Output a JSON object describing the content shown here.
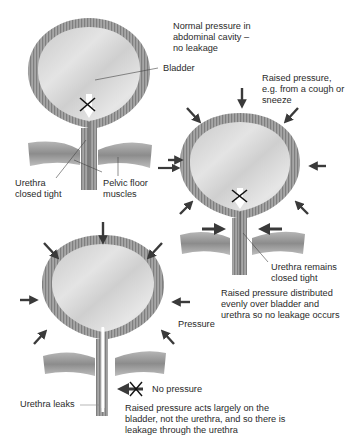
{
  "panels": [
    {
      "id": "normal",
      "caption": "Normal pressure in\nabdominal cavity –\nno leakage",
      "labels": {
        "bladder": "Bladder",
        "urethra": "Urethra\nclosed tight",
        "pelvic_floor": "Pelvic floor\nmuscles"
      }
    },
    {
      "id": "raised-distributed",
      "caption": "Raised pressure,\ne.g. from a cough or\nsneeze",
      "labels": {
        "urethra": "Urethra remains\nclosed tight"
      },
      "description": "Raised pressure distributed\nevenly over bladder and\nurethra so no leakage occurs"
    },
    {
      "id": "raised-leak",
      "labels": {
        "pressure": "Pressure",
        "no_pressure": "No pressure",
        "urethra": "Urethra leaks"
      },
      "description": "Raised pressure acts largely on the\nbladder, not the urethra, and so there is\nleakage through the urethra"
    }
  ],
  "colors": {
    "wall": "#9a9a9a",
    "wall_dark": "#7a7a7a",
    "lumen": "#d6d6d6",
    "arrow": "#3a3a3a",
    "text": "#2a2a2a"
  }
}
